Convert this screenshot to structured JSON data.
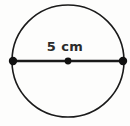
{
  "figure": {
    "kind": "circle-with-diameter",
    "background_color": "#fdfdfc",
    "stroke_color": "#1a1a1a",
    "label_color": "#2b2b2b"
  },
  "circle": {
    "name": "circle-outline",
    "center_x": 68,
    "center_y": 61,
    "radius": 56,
    "stroke_width": 1.6,
    "fill": "none"
  },
  "diameter": {
    "name": "diameter-segment",
    "x1": 13,
    "y1": 61,
    "x2": 123,
    "y2": 61,
    "stroke_width": 2.6,
    "length_value": 5,
    "length_unit": "cm",
    "label": "5 cm"
  },
  "points": [
    {
      "name": "left-endpoint-dot",
      "x": 13,
      "y": 61,
      "r": 4.2
    },
    {
      "name": "center-dot",
      "x": 68,
      "y": 61,
      "r": 3.4
    },
    {
      "name": "right-endpoint-dot",
      "x": 123,
      "y": 61,
      "r": 4.2
    }
  ],
  "label": {
    "text": "5 cm",
    "top": 39,
    "font_size": 13
  }
}
